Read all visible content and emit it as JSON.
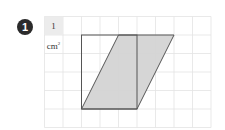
{
  "problem": {
    "number": "1"
  },
  "grid": {
    "unit_label": "1 cm",
    "unit_superscript": "2",
    "cell_size_px": 18.5,
    "origin_x": 44.5,
    "origin_y": 16.5,
    "columns": 9,
    "rows": 6,
    "line_color": "#e3e3e3",
    "unit_cell_fill": "#ececec"
  },
  "shapes": {
    "rectangle": {
      "description": "3 x 4 rectangle",
      "stroke": "#555555"
    },
    "parallelogram": {
      "description": "parallelogram with base 3 and height 4, shifted 2 cells",
      "fill": "#d4d4d4",
      "stroke": "#555555"
    }
  },
  "colors": {
    "badge": "#2b2b2b"
  }
}
